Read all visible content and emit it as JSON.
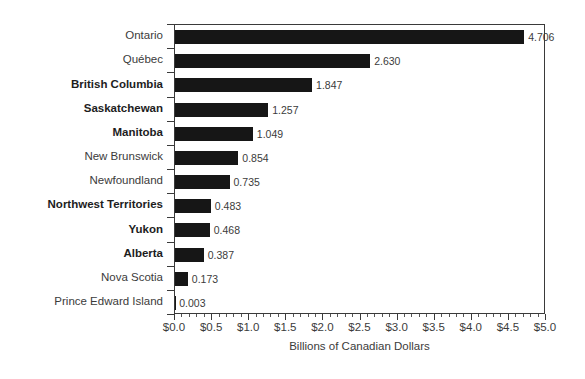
{
  "chart_data": {
    "type": "bar",
    "orientation": "horizontal",
    "title": "",
    "xlabel": "Billions of Canadian Dollars",
    "ylabel": "",
    "xlim": [
      0.0,
      5.0
    ],
    "grid": false,
    "legend": null,
    "bar_color": "#161616",
    "axis_color": "#3a3a3a",
    "text_color": "#3b3b3b",
    "x_tick_labels": [
      "$0.0",
      "$0.5",
      "$1.0",
      "$1.5",
      "$2.0",
      "$2.5",
      "$3.0",
      "$3.5",
      "$4.0",
      "$4.5",
      "$5.0"
    ],
    "x_tick_values": [
      0.0,
      0.5,
      1.0,
      1.5,
      2.0,
      2.5,
      3.0,
      3.5,
      4.0,
      4.5,
      5.0
    ],
    "minor_tick_step": 0.1,
    "categories": [
      "Ontario",
      "Québec",
      "British Columbia",
      "Saskatchewan",
      "Manitoba",
      "New Brunswick",
      "Newfoundland",
      "Northwest Territories",
      "Yukon",
      "Alberta",
      "Nova Scotia",
      "Prince Edward Island"
    ],
    "values": [
      4.706,
      2.63,
      1.847,
      1.257,
      1.049,
      0.854,
      0.735,
      0.483,
      0.468,
      0.387,
      0.173,
      0.003
    ],
    "value_labels": [
      "4.706",
      "2.630",
      "1.847",
      "1.257",
      "1.049",
      "0.854",
      "0.735",
      "0.483",
      "0.468",
      "0.387",
      "0.173",
      "0.003"
    ],
    "bold_categories": [
      false,
      false,
      true,
      true,
      true,
      false,
      false,
      true,
      true,
      true,
      false,
      false
    ]
  }
}
